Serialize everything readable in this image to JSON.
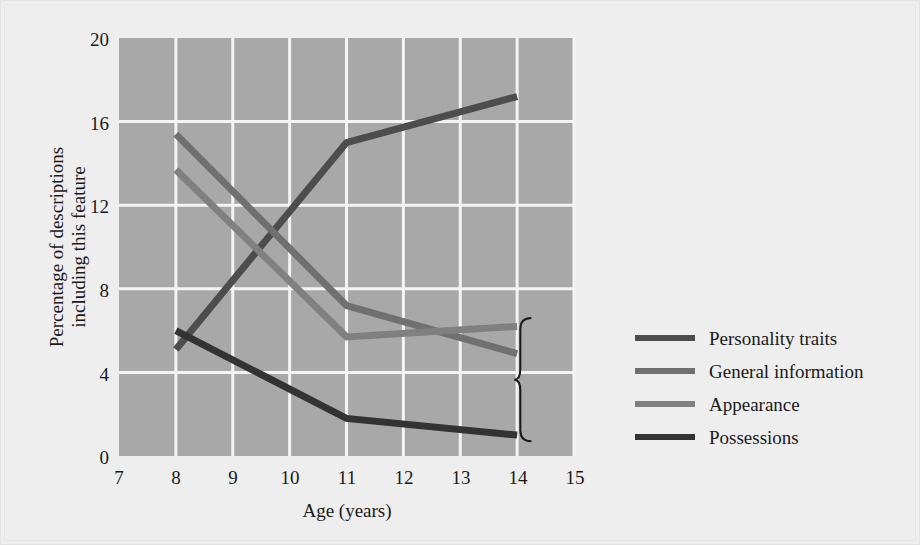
{
  "chart_data": {
    "type": "line",
    "title": "",
    "xlabel": "Age (years)",
    "ylabel": "Percentage of descriptions including this feature",
    "ylabel_line1": "Percentage of descriptions",
    "ylabel_line2": "including this feature",
    "xlim": [
      7,
      15
    ],
    "ylim": [
      0,
      20
    ],
    "xticks": [
      "7",
      "8",
      "9",
      "10",
      "11",
      "12",
      "13",
      "14",
      "15"
    ],
    "yticks": [
      "0",
      "4",
      "8",
      "12",
      "16",
      "20"
    ],
    "grid": true,
    "legend_position": "right",
    "x": [
      8,
      11,
      14
    ],
    "series": [
      {
        "name": "Personality traits",
        "color": "#4d4d4d",
        "values": [
          5.1,
          15.0,
          17.2
        ]
      },
      {
        "name": "General information",
        "color": "#707070",
        "values": [
          15.4,
          7.2,
          4.9
        ]
      },
      {
        "name": "Appearance",
        "color": "#808080",
        "values": [
          13.7,
          5.7,
          6.2
        ]
      },
      {
        "name": "Possessions",
        "color": "#333333",
        "values": [
          6.0,
          1.8,
          1.0
        ]
      }
    ],
    "annotations": [
      {
        "type": "brace",
        "label": "",
        "x": 14.25,
        "y_top": 6.6,
        "y_bottom": 0.7
      }
    ]
  },
  "legend": {
    "items": [
      {
        "label": "Personality traits",
        "color": "#4d4d4d"
      },
      {
        "label": "General information",
        "color": "#707070"
      },
      {
        "label": "Appearance",
        "color": "#808080"
      },
      {
        "label": "Possessions",
        "color": "#333333"
      }
    ]
  },
  "axes": {
    "x_title": "Age (years)",
    "y_title_line1": "Percentage of descriptions",
    "y_title_line2": "including this feature",
    "x_tick_0": "7",
    "x_tick_1": "8",
    "x_tick_2": "9",
    "x_tick_3": "10",
    "x_tick_4": "11",
    "x_tick_5": "12",
    "x_tick_6": "13",
    "x_tick_7": "14",
    "x_tick_8": "15",
    "y_tick_0": "0",
    "y_tick_1": "4",
    "y_tick_2": "8",
    "y_tick_3": "12",
    "y_tick_4": "16",
    "y_tick_5": "20"
  },
  "colors": {
    "plot_background": "#a8a8a8",
    "figure_background": "#eeeeee",
    "grid": "#f4f4f4",
    "text": "#1a1a1a"
  }
}
